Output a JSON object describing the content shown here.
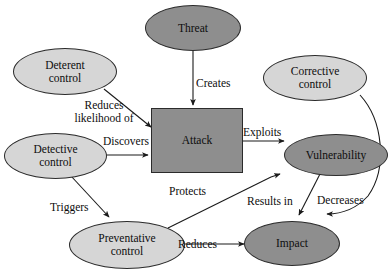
{
  "diagram": {
    "colors": {
      "node_fill_light": "#d6d6d6",
      "node_fill_dark": "#8e8e8e",
      "node_stroke": "#2b2b2b",
      "edge_stroke": "#1a1a1a",
      "background": "#ffffff",
      "text": "#0d0d0d"
    },
    "nodes": [
      {
        "id": "threat",
        "label": "Threat",
        "shape": "ellipse",
        "fill": "dark"
      },
      {
        "id": "deterent",
        "label_line1": "Deterent",
        "label_line2": "control",
        "shape": "ellipse",
        "fill": "light"
      },
      {
        "id": "corrective",
        "label_line1": "Corrective",
        "label_line2": "control",
        "shape": "ellipse",
        "fill": "light"
      },
      {
        "id": "attack",
        "label": "Attack",
        "shape": "rectangle",
        "fill": "dark"
      },
      {
        "id": "detective",
        "label_line1": "Detective",
        "label_line2": "control",
        "shape": "ellipse",
        "fill": "light"
      },
      {
        "id": "vulnerability",
        "label": "Vulnerability",
        "shape": "ellipse",
        "fill": "dark"
      },
      {
        "id": "preventative",
        "label_line1": "Preventative",
        "label_line2": "control",
        "shape": "ellipse",
        "fill": "light"
      },
      {
        "id": "impact",
        "label": "Impact",
        "shape": "ellipse",
        "fill": "dark"
      }
    ],
    "edges": [
      {
        "id": "threat-attack",
        "from": "threat",
        "to": "attack",
        "label": "Creates"
      },
      {
        "id": "deterent-attack",
        "from": "deterent",
        "to": "attack",
        "label_line1": "Reduces",
        "label_line2": "likelihood of"
      },
      {
        "id": "detective-attack",
        "from": "detective",
        "to": "attack",
        "label": "Discovers"
      },
      {
        "id": "attack-vulnerability",
        "from": "attack",
        "to": "vulnerability",
        "label": "Exploits"
      },
      {
        "id": "detective-preventative",
        "from": "detective",
        "to": "preventative",
        "label": "Triggers"
      },
      {
        "id": "preventative-attack",
        "from": "preventative",
        "to": "attack",
        "label": "Protects"
      },
      {
        "id": "preventative-impact",
        "from": "preventative",
        "to": "impact",
        "label": "Reduces"
      },
      {
        "id": "vulnerability-impact",
        "from": "vulnerability",
        "to": "impact",
        "label": "Results in"
      },
      {
        "id": "corrective-impact",
        "from": "corrective",
        "to": "impact",
        "label": "Decreases"
      }
    ]
  }
}
